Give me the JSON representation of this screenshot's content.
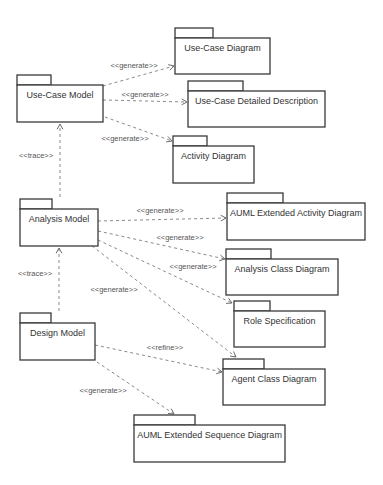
{
  "diagram": {
    "type": "UML package diagram",
    "packages": [
      {
        "id": "use_case_model",
        "label": "Use-Case Model",
        "x": 17,
        "y": 75,
        "w": 86,
        "h": 47,
        "tab_w": 34
      },
      {
        "id": "use_case_diagram",
        "label": "Use-Case Diagram",
        "x": 175,
        "y": 28,
        "w": 95,
        "h": 46,
        "tab_w": 38
      },
      {
        "id": "use_case_detailed",
        "label": "Use-Case Detailed Description",
        "x": 188,
        "y": 81,
        "w": 137,
        "h": 46,
        "tab_w": 55
      },
      {
        "id": "activity_diagram",
        "label": "Activity Diagram",
        "x": 173,
        "y": 136,
        "w": 81,
        "h": 47,
        "tab_w": 34
      },
      {
        "id": "analysis_model",
        "label": "Analysis Model",
        "x": 20,
        "y": 199,
        "w": 78,
        "h": 47,
        "tab_w": 32
      },
      {
        "id": "auml_activity",
        "label": "AUML Extended Activity Diagram",
        "x": 227,
        "y": 193,
        "w": 138,
        "h": 47,
        "tab_w": 56
      },
      {
        "id": "analysis_class",
        "label": "Analysis Class Diagram",
        "x": 226,
        "y": 249,
        "w": 112,
        "h": 46,
        "tab_w": 45
      },
      {
        "id": "role_spec",
        "label": "Role Specification",
        "x": 234,
        "y": 301,
        "w": 91,
        "h": 46,
        "tab_w": 36
      },
      {
        "id": "design_model",
        "label": "Design Model",
        "x": 20,
        "y": 313,
        "w": 75,
        "h": 47,
        "tab_w": 31
      },
      {
        "id": "agent_class",
        "label": "Agent Class Diagram",
        "x": 223,
        "y": 359,
        "w": 102,
        "h": 46,
        "tab_w": 41
      },
      {
        "id": "auml_sequence",
        "label": "AUML Extended Sequence Diagram",
        "x": 134,
        "y": 415,
        "w": 151,
        "h": 47,
        "tab_w": 61
      }
    ],
    "dependencies": [
      {
        "from": "use_case_model",
        "to": "use_case_diagram",
        "stereotype": "<<generate>>",
        "x1": 103,
        "y1": 86,
        "x2": 174,
        "y2": 66,
        "lx": 134,
        "ly": 68
      },
      {
        "from": "use_case_model",
        "to": "use_case_detailed",
        "stereotype": "<<generate>>",
        "x1": 103,
        "y1": 100,
        "x2": 187,
        "y2": 102,
        "lx": 145,
        "ly": 97
      },
      {
        "from": "use_case_model",
        "to": "activity_diagram",
        "stereotype": "<<generate>>",
        "x1": 105,
        "y1": 117,
        "x2": 172,
        "y2": 141,
        "lx": 125,
        "ly": 141
      },
      {
        "from": "analysis_model",
        "to": "use_case_model",
        "stereotype": "<<trace>>",
        "x1": 60,
        "y1": 197,
        "x2": 60,
        "y2": 124,
        "lx": 36,
        "ly": 158
      },
      {
        "from": "analysis_model",
        "to": "auml_activity",
        "stereotype": "<<generate>>",
        "x1": 98,
        "y1": 221,
        "x2": 226,
        "y2": 218,
        "lx": 160,
        "ly": 213
      },
      {
        "from": "analysis_model",
        "to": "analysis_class",
        "stereotype": "<<generate>>",
        "x1": 98,
        "y1": 231,
        "x2": 225,
        "y2": 259,
        "lx": 180,
        "ly": 240
      },
      {
        "from": "analysis_model",
        "to": "role_spec",
        "stereotype": "<<generate>>",
        "x1": 98,
        "y1": 240,
        "x2": 232,
        "y2": 303,
        "lx": 193,
        "ly": 269
      },
      {
        "from": "analysis_model",
        "to": "agent_class",
        "stereotype": "<<generate>>",
        "x1": 92,
        "y1": 246,
        "x2": 236,
        "y2": 357,
        "lx": 114,
        "ly": 292
      },
      {
        "from": "design_model",
        "to": "analysis_model",
        "stereotype": "<<trace>>",
        "x1": 59,
        "y1": 311,
        "x2": 59,
        "y2": 248,
        "lx": 35,
        "ly": 276
      },
      {
        "from": "design_model",
        "to": "agent_class",
        "stereotype": "<<refine>>",
        "x1": 95,
        "y1": 345,
        "x2": 222,
        "y2": 372,
        "lx": 165,
        "ly": 350
      },
      {
        "from": "design_model",
        "to": "auml_sequence",
        "stereotype": "<<generate>>",
        "x1": 97,
        "y1": 362,
        "x2": 174,
        "y2": 414,
        "lx": 103,
        "ly": 393
      }
    ]
  }
}
